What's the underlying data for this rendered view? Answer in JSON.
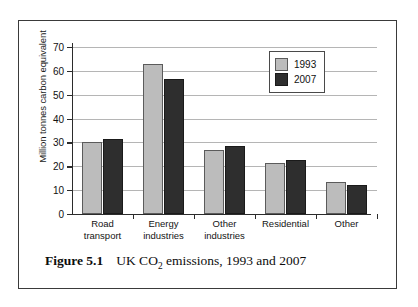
{
  "top_fragment": "",
  "caption": {
    "label": "Figure 5.1",
    "text_before": "UK CO",
    "subscript": "2",
    "text_after": " emissions, 1993 and 2007"
  },
  "legend": {
    "entries": [
      {
        "name": "1993",
        "color": "#bcbcbc"
      },
      {
        "name": "2007",
        "color": "#2e2e2e"
      }
    ]
  },
  "chart_data": {
    "type": "bar",
    "title": "UK CO2 emissions, 1993 and 2007",
    "xlabel": "",
    "ylabel": "Million tonnes carbon equivalent",
    "ylim": [
      0,
      70
    ],
    "yticks": [
      0,
      10,
      20,
      30,
      40,
      50,
      60,
      70
    ],
    "ytick_labels": [
      "0",
      "10",
      "20",
      "30",
      "40",
      "50",
      "60",
      "70"
    ],
    "grid": true,
    "legend_position": "top-right",
    "categories": [
      "Road\ntransport",
      "Energy\nindustries",
      "Other\nindustries",
      "Residential",
      "Other"
    ],
    "series": [
      {
        "name": "1993",
        "color": "#bcbcbc",
        "values": [
          30.0,
          63.0,
          27.0,
          21.5,
          13.3
        ]
      },
      {
        "name": "2007",
        "color": "#2e2e2e",
        "values": [
          31.5,
          56.8,
          28.5,
          22.8,
          12.0
        ]
      }
    ]
  }
}
